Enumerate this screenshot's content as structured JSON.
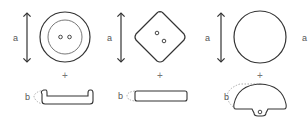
{
  "diagram": {
    "items": [
      {
        "id": "round-two-hole",
        "top_shape": "circle with inner rim and 2 holes",
        "side_shape": "flat with raised rim",
        "dimension_a_label": "a",
        "dimension_b_label": "b",
        "connector": "+"
      },
      {
        "id": "square-two-hole",
        "top_shape": "rounded diamond with 2 holes",
        "side_shape": "flat bar",
        "dimension_a_label": "a",
        "dimension_b_label": "b",
        "connector": "+"
      },
      {
        "id": "shank-dome",
        "top_shape": "plain circle",
        "side_shape": "dome with shank loop",
        "dimension_a_label": "a",
        "dimension_b_label": "b",
        "connector": "+"
      }
    ],
    "edge_label": "a",
    "colors": {
      "stroke": "#333333",
      "label": "#555555",
      "dashed": "#888888",
      "background": "#ffffff"
    }
  }
}
